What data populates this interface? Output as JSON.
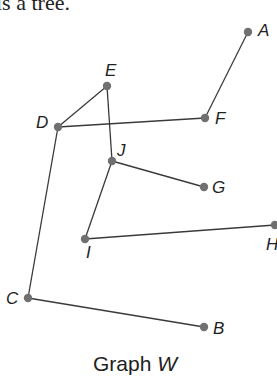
{
  "top_text": "is a tree.",
  "graph": {
    "caption": "Graph ",
    "caption_var": "W",
    "nodes": [
      {
        "id": "A",
        "x": 248,
        "y": 32,
        "lx": 258,
        "ly": 36
      },
      {
        "id": "B",
        "x": 204,
        "y": 327,
        "lx": 213,
        "ly": 334
      },
      {
        "id": "C",
        "x": 28,
        "y": 298,
        "lx": 6,
        "ly": 304
      },
      {
        "id": "D",
        "x": 58,
        "y": 127,
        "lx": 36,
        "ly": 128
      },
      {
        "id": "E",
        "x": 107,
        "y": 86,
        "lx": 105,
        "ly": 76
      },
      {
        "id": "F",
        "x": 205,
        "y": 118,
        "lx": 215,
        "ly": 124
      },
      {
        "id": "G",
        "x": 204,
        "y": 187,
        "lx": 212,
        "ly": 193
      },
      {
        "id": "H",
        "x": 275,
        "y": 225,
        "lx": 266,
        "ly": 250
      },
      {
        "id": "I",
        "x": 85,
        "y": 239,
        "lx": 86,
        "ly": 258
      },
      {
        "id": "J",
        "x": 112,
        "y": 161,
        "lx": 117,
        "ly": 156
      }
    ],
    "edges": [
      [
        "A",
        "F"
      ],
      [
        "D",
        "E"
      ],
      [
        "D",
        "F"
      ],
      [
        "E",
        "J"
      ],
      [
        "J",
        "G"
      ],
      [
        "J",
        "I"
      ],
      [
        "I",
        "H"
      ],
      [
        "D",
        "C"
      ],
      [
        "C",
        "B"
      ]
    ]
  }
}
